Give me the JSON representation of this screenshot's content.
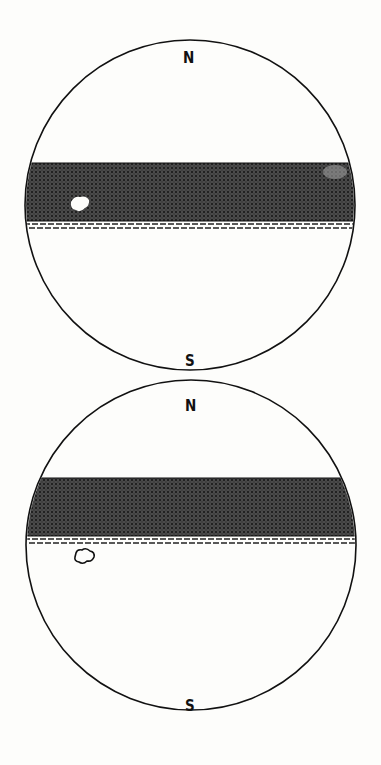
{
  "figure": {
    "type": "two stereographic / field-of-view circles with shaded horizontal band",
    "background_color": "#fdfdfb",
    "ink_color": "#111111",
    "band_color": "#3a3a3a"
  },
  "panels": [
    {
      "id": "top",
      "north_label": "N",
      "south_label": "S",
      "circle": {
        "cx": 190,
        "cy": 205,
        "r": 165
      },
      "band": {
        "top_y": 163,
        "bottom_y": 221,
        "note": "shaded band spanning full width of circle"
      },
      "dashed_rule": {
        "y1": 223,
        "y2": 228,
        "style": "double dashed line below band"
      },
      "spot": {
        "type": "white filled blob inside band",
        "cx": 79,
        "cy": 205
      }
    },
    {
      "id": "bottom",
      "north_label": "N",
      "south_label": "S",
      "circle": {
        "cx": 191,
        "cy": 545,
        "r": 165
      },
      "band": {
        "top_y": 478,
        "bottom_y": 536,
        "note": "shaded band spanning full width of circle"
      },
      "dashed_rule": {
        "y1": 538,
        "y2": 544,
        "style": "double dashed line below band"
      },
      "spot": {
        "type": "outlined open blob below band",
        "cx": 83,
        "cy": 557
      }
    }
  ]
}
